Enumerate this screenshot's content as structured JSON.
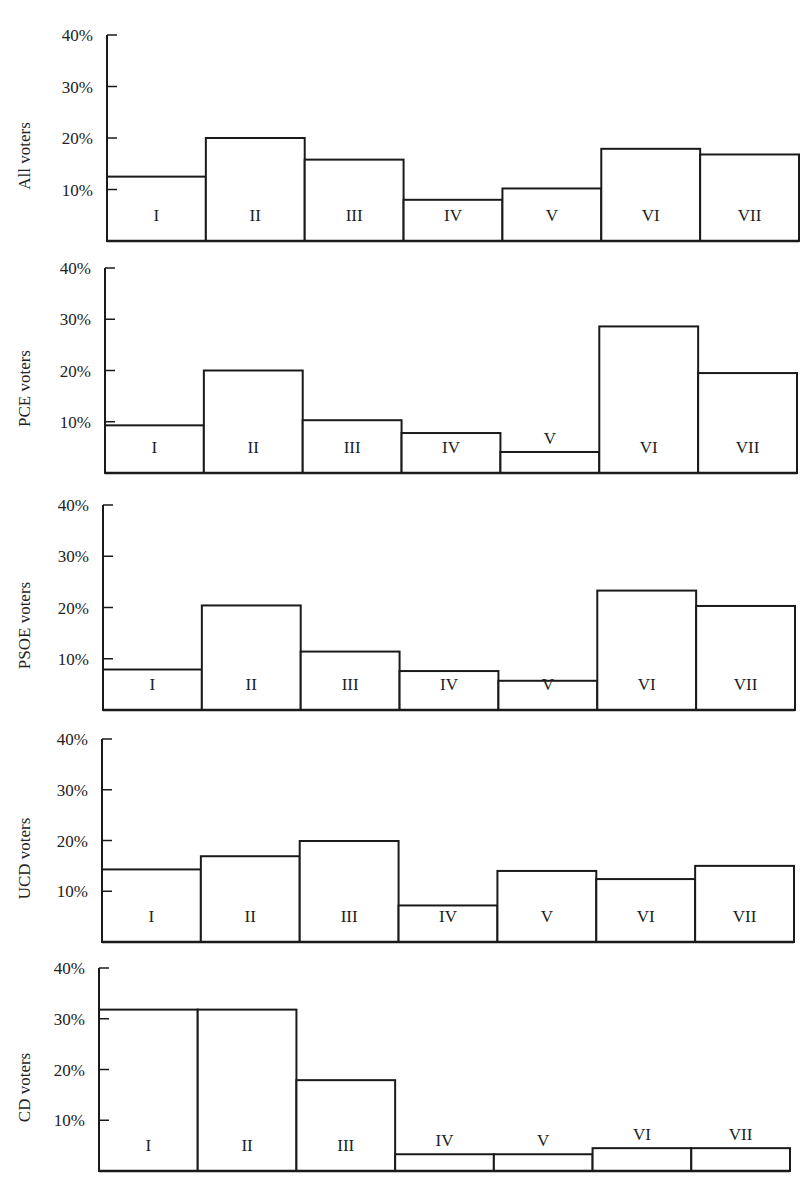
{
  "chart_data": [
    {
      "type": "bar",
      "title": "",
      "ylabel": "All voters",
      "xlabel": "",
      "categories": [
        "I",
        "II",
        "III",
        "IV",
        "V",
        "VI",
        "VII"
      ],
      "values": [
        12.5,
        20,
        15.8,
        8,
        10.2,
        17.9,
        16.8
      ],
      "ylim": [
        0,
        40
      ],
      "yticks": [
        "10%",
        "20%",
        "30%",
        "40%"
      ],
      "grid": false,
      "legend": null,
      "label_position": [
        "inside",
        "inside",
        "inside",
        "inside",
        "inside",
        "inside",
        "inside"
      ]
    },
    {
      "type": "bar",
      "title": "",
      "ylabel": "PCE voters",
      "xlabel": "",
      "categories": [
        "I",
        "II",
        "III",
        "IV",
        "V",
        "VI",
        "VII"
      ],
      "values": [
        9.3,
        20,
        10.3,
        7.8,
        4.1,
        28.6,
        19.5
      ],
      "ylim": [
        0,
        40
      ],
      "yticks": [
        "10%",
        "20%",
        "30%",
        "40%"
      ],
      "grid": false,
      "legend": null,
      "label_position": [
        "inside",
        "inside",
        "inside",
        "inside",
        "above",
        "inside",
        "inside"
      ]
    },
    {
      "type": "bar",
      "title": "",
      "ylabel": "PSOE voters",
      "xlabel": "",
      "categories": [
        "I",
        "II",
        "III",
        "IV",
        "V",
        "VI",
        "VII"
      ],
      "values": [
        7.9,
        20.4,
        11.4,
        7.6,
        5.7,
        23.3,
        20.3
      ],
      "ylim": [
        0,
        40
      ],
      "yticks": [
        "10%",
        "20%",
        "30%",
        "40%"
      ],
      "grid": false,
      "legend": null,
      "label_position": [
        "inside",
        "inside",
        "inside",
        "inside",
        "inside",
        "inside",
        "inside"
      ]
    },
    {
      "type": "bar",
      "title": "",
      "ylabel": "UCD voters",
      "xlabel": "",
      "categories": [
        "I",
        "II",
        "III",
        "IV",
        "V",
        "VI",
        "VII"
      ],
      "values": [
        14.3,
        16.9,
        19.9,
        7.2,
        14,
        12.4,
        15
      ],
      "ylim": [
        0,
        40
      ],
      "yticks": [
        "10%",
        "20%",
        "30%",
        "40%"
      ],
      "grid": false,
      "legend": null,
      "label_position": [
        "inside",
        "inside",
        "inside",
        "inside",
        "inside",
        "inside",
        "inside"
      ]
    },
    {
      "type": "bar",
      "title": "",
      "ylabel": "CD voters",
      "xlabel": "",
      "categories": [
        "I",
        "II",
        "III",
        "IV",
        "V",
        "VI",
        "VII"
      ],
      "values": [
        31.8,
        31.8,
        17.9,
        3.3,
        3.3,
        4.5,
        4.5
      ],
      "ylim": [
        0,
        40
      ],
      "yticks": [
        "10%",
        "20%",
        "30%",
        "40%"
      ],
      "grid": false,
      "legend": null,
      "label_position": [
        "inside",
        "inside",
        "inside",
        "above",
        "above",
        "above",
        "above"
      ]
    }
  ],
  "layout": {
    "panels": [
      {
        "axis_x": 107,
        "right_x": 799,
        "top_y": 35,
        "base_y": 241
      },
      {
        "axis_x": 105,
        "right_x": 797,
        "top_y": 268,
        "base_y": 473
      },
      {
        "axis_x": 103,
        "right_x": 795,
        "top_y": 505,
        "base_y": 710
      },
      {
        "axis_x": 102,
        "right_x": 794,
        "top_y": 739,
        "base_y": 942
      },
      {
        "axis_x": 99,
        "right_x": 790,
        "top_y": 968,
        "base_y": 1171
      }
    ],
    "line_color": "#1a1a1a",
    "bar_fill": "#ffffff",
    "background": "#ffffff"
  }
}
